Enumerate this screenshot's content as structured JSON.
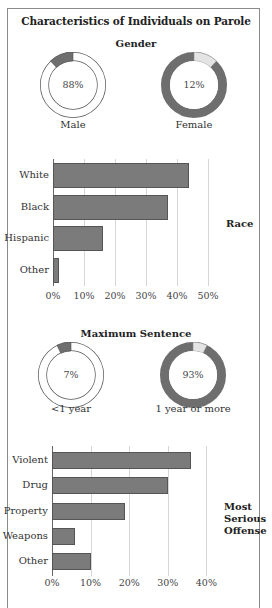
{
  "title": "Characteristics of Individuals on Parole",
  "gender": {
    "heading": "Gender",
    "donuts": [
      {
        "label": "Male",
        "value_text": "88%",
        "value": 88
      },
      {
        "label": "Female",
        "value_text": "12%",
        "value": 12
      }
    ]
  },
  "race": {
    "side_label": "Race",
    "categories": [
      "White",
      "Black",
      "Hispanic",
      "Other"
    ],
    "values": [
      44,
      37,
      16,
      2
    ],
    "ticks": [
      "0%",
      "10%",
      "20%",
      "30%",
      "40%",
      "50%"
    ]
  },
  "sentence": {
    "heading": "Maximum Sentence",
    "donuts": [
      {
        "label": "<1 year",
        "value_text": "7%",
        "value": 7
      },
      {
        "label": "1 year or more",
        "value_text": "93%",
        "value": 93
      }
    ]
  },
  "offense": {
    "side_label_lines": [
      "Most",
      "Serious",
      "Offense"
    ],
    "categories": [
      "Violent",
      "Drug",
      "Property",
      "Weapons",
      "Other"
    ],
    "values": [
      36,
      30,
      19,
      6,
      10
    ],
    "ticks": [
      "0%",
      "10%",
      "20%",
      "30%",
      "40%"
    ]
  },
  "colors": {
    "bar": "#7b7b7b",
    "donut_dark": "#6e6e6e",
    "donut_light": "#e4e4e4",
    "donut_white": "#ffffff"
  },
  "chart_data": [
    {
      "type": "pie",
      "title": "Gender",
      "categories": [
        "Male",
        "Female"
      ],
      "values": [
        88,
        12
      ],
      "unit": "%"
    },
    {
      "type": "bar",
      "title": "Race",
      "orientation": "horizontal",
      "categories": [
        "White",
        "Black",
        "Hispanic",
        "Other"
      ],
      "values": [
        44,
        37,
        16,
        2
      ],
      "xlabel": "",
      "ylabel": "",
      "xlim": [
        0,
        50
      ],
      "tick_labels": [
        "0%",
        "10%",
        "20%",
        "30%",
        "40%",
        "50%"
      ],
      "grid": true
    },
    {
      "type": "pie",
      "title": "Maximum Sentence",
      "categories": [
        "<1 year",
        "1 year or more"
      ],
      "values": [
        7,
        93
      ],
      "unit": "%"
    },
    {
      "type": "bar",
      "title": "Most Serious Offense",
      "orientation": "horizontal",
      "categories": [
        "Violent",
        "Drug",
        "Property",
        "Weapons",
        "Other"
      ],
      "values": [
        36,
        30,
        19,
        6,
        10
      ],
      "xlim": [
        0,
        40
      ],
      "tick_labels": [
        "0%",
        "10%",
        "20%",
        "30%",
        "40%"
      ],
      "grid": true
    }
  ]
}
